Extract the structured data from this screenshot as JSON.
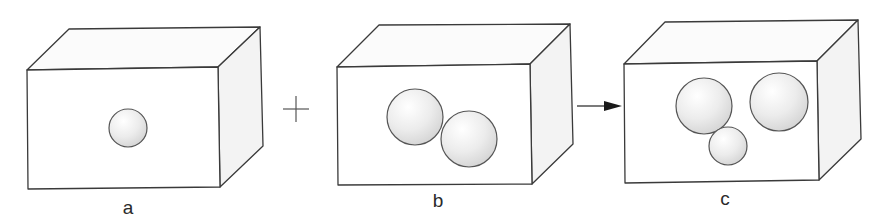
{
  "figure": {
    "panels": [
      {
        "id": "a",
        "label": "a",
        "box": {
          "front": [
            [
              27,
              70
            ],
            [
              218,
              67
            ],
            [
              220,
              187
            ],
            [
              28,
              189
            ]
          ],
          "top": [
            [
              27,
              70
            ],
            [
              69,
              29
            ],
            [
              260,
              27
            ],
            [
              218,
              67
            ]
          ],
          "side": [
            [
              218,
              67
            ],
            [
              260,
              27
            ],
            [
              263,
              146
            ],
            [
              220,
              187
            ]
          ]
        },
        "circles": [
          {
            "cx": 128,
            "cy": 128,
            "r": 19
          }
        ],
        "label_pos": [
          128,
          198
        ]
      },
      {
        "id": "b",
        "label": "b",
        "box": {
          "front": [
            [
              337,
              67
            ],
            [
              530,
              64
            ],
            [
              532,
              184
            ],
            [
              338,
              185
            ]
          ],
          "top": [
            [
              337,
              67
            ],
            [
              379,
              25
            ],
            [
              570,
              24
            ],
            [
              530,
              64
            ]
          ],
          "side": [
            [
              530,
              64
            ],
            [
              570,
              24
            ],
            [
              573,
              144
            ],
            [
              532,
              184
            ]
          ]
        },
        "circles": [
          {
            "cx": 415,
            "cy": 117,
            "r": 28
          },
          {
            "cx": 469,
            "cy": 139,
            "r": 28
          }
        ],
        "label_pos": [
          438,
          191
        ]
      },
      {
        "id": "c",
        "label": "c",
        "box": {
          "front": [
            [
              624,
              64
            ],
            [
              817,
              61
            ],
            [
              819,
              180
            ],
            [
              625,
              183
            ]
          ],
          "top": [
            [
              624,
              64
            ],
            [
              665,
              22
            ],
            [
              858,
              20
            ],
            [
              817,
              61
            ]
          ],
          "side": [
            [
              817,
              61
            ],
            [
              858,
              20
            ],
            [
              861,
              139
            ],
            [
              819,
              180
            ]
          ]
        },
        "circles": [
          {
            "cx": 704,
            "cy": 106,
            "r": 28
          },
          {
            "cx": 779,
            "cy": 102,
            "r": 29
          },
          {
            "cx": 728,
            "cy": 146,
            "r": 19
          }
        ],
        "label_pos": [
          725,
          189
        ]
      }
    ],
    "operators": {
      "plus": {
        "symbol": "+",
        "cx": 296,
        "cy": 109,
        "half": 13
      },
      "arrow": {
        "symbol": "→",
        "x1": 577,
        "x2": 622,
        "y": 106
      }
    },
    "colors": {
      "stroke": "#3a3a3a",
      "face_front": "#ffffff",
      "face_top": "#fbfbfb",
      "face_side": "#f3f3f3",
      "sphere_light": "#ffffff",
      "sphere_dark": "#d6d6d6"
    }
  }
}
